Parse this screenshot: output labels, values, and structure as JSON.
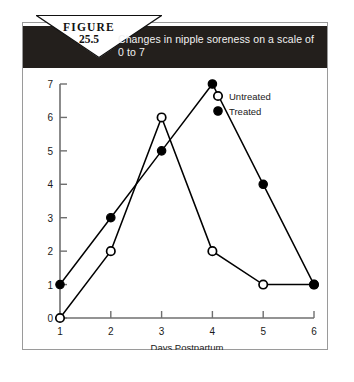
{
  "figure": {
    "word": "FIGURE",
    "number": "25.5",
    "caption": "Changes in nipple soreness on a scale of 0 to 7"
  },
  "chart_data": {
    "type": "line",
    "title": "Changes in nipple soreness on a scale of 0 to 7",
    "xlabel": "Days Postpartum",
    "ylabel": "",
    "categories": [
      1,
      2,
      3,
      4,
      5,
      6
    ],
    "x_tick_labels": [
      "1",
      "2",
      "3",
      "4",
      "5",
      "6"
    ],
    "y_tick_labels": [
      "0",
      "1",
      "2",
      "3",
      "4",
      "5",
      "6",
      "7"
    ],
    "xlim": [
      1,
      6
    ],
    "ylim": [
      0,
      7
    ],
    "grid": false,
    "legend_position": "top-right",
    "series": [
      {
        "name": "Untreated",
        "marker": "open-circle",
        "color": "#000000",
        "values": [
          0,
          2,
          6,
          2,
          1,
          1
        ]
      },
      {
        "name": "Treated",
        "marker": "filled-circle",
        "color": "#000000",
        "values": [
          1,
          3,
          5,
          7,
          4,
          1
        ]
      }
    ]
  },
  "colors": {
    "banner_bg": "#231f1c",
    "banner_text": "#f2f2f2",
    "frame": "#9a9a9a",
    "ink": "#1a1a1a"
  }
}
